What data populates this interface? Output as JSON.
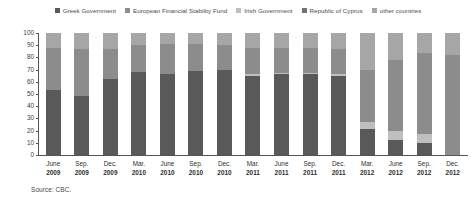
{
  "legend": {
    "items": [
      {
        "label": "Greek Government",
        "color": "#595959",
        "key": "greek_government"
      },
      {
        "label": "European Financial Stability Fund",
        "color": "#8c8c8c",
        "key": "efsf"
      },
      {
        "label": "Irish Government",
        "color": "#bfbfbf",
        "key": "irish_government"
      },
      {
        "label": "Republic of Cyprus",
        "color": "#737373",
        "key": "republic_of_cyprus"
      },
      {
        "label": "other countries",
        "color": "#a6a6a6",
        "key": "other_countries"
      }
    ]
  },
  "source": {
    "text": "Source: CBC."
  },
  "axis": {
    "y_ticks": [
      "100",
      "90",
      "80",
      "70",
      "60",
      "50",
      "40",
      "30",
      "20",
      "10",
      "0"
    ]
  },
  "chart_data": {
    "type": "bar",
    "stacked": true,
    "stack_mode": "percent",
    "title": "",
    "subtitle": "",
    "xlabel": "",
    "ylabel": "",
    "ylim": [
      0,
      100
    ],
    "yticks": [
      0,
      10,
      20,
      30,
      40,
      50,
      60,
      70,
      80,
      90,
      100
    ],
    "grid": false,
    "legend_position": "top",
    "categories": [
      "June 2009",
      "Sep. 2009",
      "Dec. 2009",
      "Mar. 2010",
      "June 2010",
      "Sep. 2010",
      "Dec. 2010",
      "Mar. 2011",
      "June 2011",
      "Sep. 2011",
      "Dec. 2011",
      "Mar. 2012",
      "June 2012",
      "Sep. 2012",
      "Dec. 2012"
    ],
    "category_months": [
      "June",
      "Sep.",
      "Dec.",
      "Mar.",
      "June",
      "Sep.",
      "Dec.",
      "Mar.",
      "June",
      "Sep.",
      "Dec.",
      "Mar.",
      "June",
      "Sep.",
      "Dec."
    ],
    "category_years": [
      "2009",
      "2009",
      "2009",
      "2010",
      "2010",
      "2010",
      "2010",
      "2011",
      "2011",
      "2011",
      "2011",
      "2012",
      "2012",
      "2012",
      "2012"
    ],
    "series": [
      {
        "name": "Greek Government",
        "color": "#595959",
        "values": [
          53,
          48,
          62,
          68,
          66,
          69,
          70,
          65,
          66,
          66,
          65,
          21,
          12,
          10,
          0
        ]
      },
      {
        "name": "Irish Government",
        "color": "#bfbfbf",
        "values": [
          0,
          0,
          0,
          0,
          0,
          0,
          0,
          1,
          1,
          1,
          1,
          6,
          8,
          7,
          0
        ]
      },
      {
        "name": "European Financial Stability Fund",
        "color": "#8c8c8c",
        "values": [
          35,
          39,
          25,
          22,
          25,
          22,
          20,
          22,
          21,
          21,
          21,
          43,
          58,
          67,
          82
        ]
      },
      {
        "name": "Republic of Cyprus",
        "color": "#737373",
        "values": [
          0,
          0,
          0,
          0,
          0,
          0,
          0,
          0,
          0,
          0,
          0,
          0,
          0,
          0,
          0
        ]
      },
      {
        "name": "other countries",
        "color": "#a6a6a6",
        "values": [
          12,
          13,
          13,
          10,
          9,
          9,
          10,
          12,
          12,
          12,
          13,
          30,
          22,
          16,
          18
        ]
      }
    ]
  }
}
